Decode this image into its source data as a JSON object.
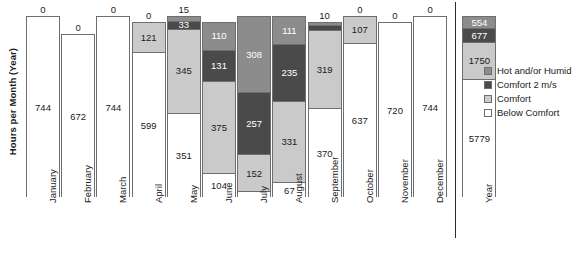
{
  "chart_data": {
    "type": "bar",
    "stacked": true,
    "title": "",
    "xlabel": "",
    "ylabel": "Hours per Month (Year)",
    "ylim": [
      0,
      8760
    ],
    "grid": false,
    "legend_position": "right",
    "categories": [
      "January",
      "February",
      "March",
      "April",
      "May",
      "June",
      "July",
      "August",
      "September",
      "October",
      "November",
      "December",
      "Year"
    ],
    "series": [
      {
        "name": "Below Comfort",
        "color": "#ffffff",
        "values": [
          744,
          672,
          744,
          599,
          351,
          104,
          27,
          67,
          370,
          637,
          720,
          744,
          5779
        ]
      },
      {
        "name": "Comfort",
        "color": "#cacaca",
        "values": [
          0,
          0,
          0,
          121,
          345,
          375,
          152,
          331,
          319,
          107,
          0,
          0,
          1750
        ]
      },
      {
        "name": "Comfort 2 m/s",
        "color": "#4a4a4a",
        "values": [
          0,
          0,
          0,
          0,
          33,
          131,
          257,
          235,
          21,
          0,
          0,
          0,
          677
        ]
      },
      {
        "name": "Hot and/or Humid",
        "color": "#8c8c8c",
        "values": [
          0,
          0,
          0,
          0,
          15,
          110,
          308,
          111,
          10,
          0,
          0,
          0,
          554
        ]
      }
    ],
    "top_labels": [
      "0",
      "0",
      "0",
      "0",
      "15",
      "",
      "",
      "",
      "10",
      "0",
      "0",
      "0",
      ""
    ],
    "bar_totals": [
      744,
      672,
      744,
      720,
      744,
      720,
      744,
      744,
      720,
      744,
      720,
      744,
      8760
    ]
  },
  "legend": {
    "items": [
      {
        "label": "Hot and/or Humid",
        "swatch": "hot"
      },
      {
        "label": "Comfort 2 m/s",
        "swatch": "c2ms"
      },
      {
        "label": "Comfort",
        "swatch": "comfort"
      },
      {
        "label": "Below Comfort",
        "swatch": "below"
      }
    ]
  }
}
